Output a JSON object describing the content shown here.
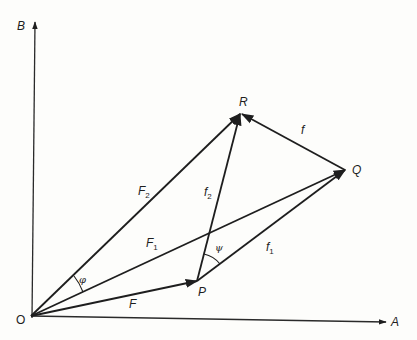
{
  "diagram": {
    "type": "vector-diagram",
    "axes": {
      "horizontal": {
        "label": "A"
      },
      "vertical": {
        "label": "B"
      },
      "origin": {
        "label": "O"
      }
    },
    "points": {
      "P": {
        "label": "P"
      },
      "Q": {
        "label": "Q"
      },
      "R": {
        "label": "R"
      }
    },
    "vectors": [
      {
        "id": "F",
        "label": "F",
        "sub": "",
        "from": "O",
        "to": "P"
      },
      {
        "id": "F1",
        "label": "F",
        "sub": "1",
        "from": "O",
        "to": "Q"
      },
      {
        "id": "F2",
        "label": "F",
        "sub": "2",
        "from": "O",
        "to": "R"
      },
      {
        "id": "f1",
        "label": "f",
        "sub": "1",
        "from": "P",
        "to": "Q"
      },
      {
        "id": "f2",
        "label": "f",
        "sub": "2",
        "from": "P",
        "to": "R"
      },
      {
        "id": "f",
        "label": "f",
        "sub": "",
        "from": "Q",
        "to": "R"
      }
    ],
    "angles": [
      {
        "id": "phi",
        "label": "φ",
        "between": [
          "F1",
          "F2"
        ],
        "vertex": "O"
      },
      {
        "id": "psi",
        "label": "ψ",
        "between": [
          "f1",
          "f2"
        ],
        "vertex": "P"
      }
    ]
  }
}
